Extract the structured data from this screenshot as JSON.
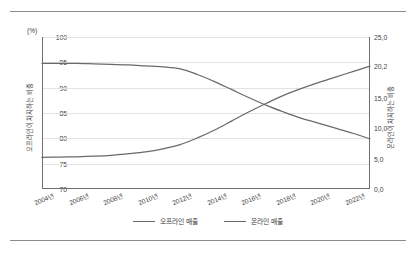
{
  "chart_data": {
    "type": "line",
    "title": "",
    "subtitle": "",
    "xlabel": "",
    "ylabel": "오프라인이 차지하는 비중",
    "y2label": "온라인이 차지하는 비중",
    "unit_label": "(%)",
    "grid": true,
    "legend_position": "bottom",
    "x": [
      "2004년",
      "2005년",
      "2006년",
      "2007년",
      "2008년",
      "2009년",
      "2010년",
      "2011년",
      "2012년",
      "2013년",
      "2014년",
      "2015년",
      "2016년",
      "2017년",
      "2018년",
      "2019년",
      "2020년",
      "2021년",
      "2022년",
      "2023년"
    ],
    "xticks": [
      "2004년",
      "2006년",
      "2008년",
      "2010년",
      "2012년",
      "2014년",
      "2016년",
      "2018년",
      "2020년",
      "2022년"
    ],
    "ylim": [
      70,
      100
    ],
    "yticks": [
      "70",
      "75",
      "80",
      "85",
      "90",
      "95",
      "100"
    ],
    "y2lim": [
      0.0,
      25.0
    ],
    "y2ticks": [
      "0,0",
      "5,0",
      "10,0",
      "15,0",
      "20,2",
      "25,0"
    ],
    "series": [
      {
        "name": "오프라인 매출",
        "axis": "left",
        "color": "#6a6a6a",
        "values": [
          94.8,
          94.8,
          94.8,
          94.7,
          94.6,
          94.5,
          94.3,
          94.1,
          93.7,
          92.6,
          91.2,
          89.6,
          88.0,
          86.5,
          85.2,
          84.0,
          83.0,
          82.0,
          81.0,
          79.9
        ]
      },
      {
        "name": "온라인 매출",
        "axis": "right",
        "color": "#6a6a6a",
        "values": [
          5.2,
          5.25,
          5.3,
          5.4,
          5.55,
          5.8,
          6.1,
          6.6,
          7.3,
          8.4,
          9.7,
          11.2,
          12.7,
          14.1,
          15.4,
          16.5,
          17.5,
          18.4,
          19.3,
          20.2
        ]
      }
    ],
    "annotations": []
  },
  "legend": {
    "items": [
      {
        "label": "오프라인 매출"
      },
      {
        "label": "온라인 매출"
      }
    ]
  }
}
